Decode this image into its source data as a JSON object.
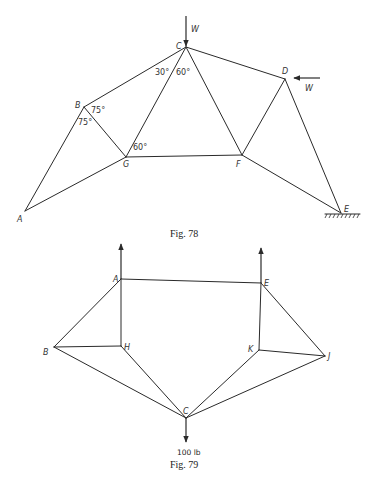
{
  "figures": [
    {
      "id": "fig78",
      "caption": "Fig. 78",
      "nodes": {
        "A": {
          "label": "A",
          "x": 25,
          "y": 211
        },
        "B": {
          "label": "B",
          "x": 84,
          "y": 107
        },
        "C": {
          "label": "C",
          "x": 186,
          "y": 47
        },
        "D": {
          "label": "D",
          "x": 285,
          "y": 79
        },
        "E": {
          "label": "E",
          "x": 341,
          "y": 213
        },
        "F": {
          "label": "F",
          "x": 242,
          "y": 155
        },
        "G": {
          "label": "G",
          "x": 126,
          "y": 157
        }
      },
      "members": [
        [
          "A",
          "B"
        ],
        [
          "B",
          "C"
        ],
        [
          "C",
          "D"
        ],
        [
          "D",
          "E"
        ],
        [
          "A",
          "G"
        ],
        [
          "B",
          "G"
        ],
        [
          "C",
          "G"
        ],
        [
          "C",
          "F"
        ],
        [
          "G",
          "F"
        ],
        [
          "D",
          "F"
        ],
        [
          "F",
          "E"
        ]
      ],
      "angles": [
        {
          "label": "30°",
          "near": "C"
        },
        {
          "label": "60°",
          "near": "C"
        },
        {
          "label": "75°",
          "near": "B"
        },
        {
          "label": "75°",
          "near": "B"
        },
        {
          "label": "60°",
          "near": "G"
        }
      ],
      "loads": [
        {
          "label": "W",
          "at": "C",
          "direction": "down"
        },
        {
          "label": "W",
          "at": "D",
          "direction": "left"
        }
      ],
      "support": {
        "at": "E",
        "type": "fixed ground"
      }
    },
    {
      "id": "fig79",
      "caption": "Fig. 79",
      "nodes": {
        "A": {
          "label": "A",
          "x": 121,
          "y": 279
        },
        "B": {
          "label": "B",
          "x": 54,
          "y": 347
        },
        "C": {
          "label": "C",
          "x": 186,
          "y": 418
        },
        "E": {
          "label": "E",
          "x": 261,
          "y": 283
        },
        "H": {
          "label": "H",
          "x": 121,
          "y": 346
        },
        "J": {
          "label": "J",
          "x": 325,
          "y": 356
        },
        "K": {
          "label": "K",
          "x": 259,
          "y": 350
        }
      },
      "members": [
        [
          "A",
          "E"
        ],
        [
          "A",
          "B"
        ],
        [
          "A",
          "H"
        ],
        [
          "B",
          "H"
        ],
        [
          "B",
          "C"
        ],
        [
          "H",
          "C"
        ],
        [
          "E",
          "K"
        ],
        [
          "E",
          "J"
        ],
        [
          "K",
          "J"
        ],
        [
          "K",
          "C"
        ],
        [
          "J",
          "C"
        ]
      ],
      "loads": [
        {
          "label": "",
          "at": "A",
          "direction": "up"
        },
        {
          "label": "",
          "at": "E",
          "direction": "up"
        },
        {
          "label": "100 lb",
          "at": "C",
          "direction": "down"
        }
      ]
    }
  ]
}
